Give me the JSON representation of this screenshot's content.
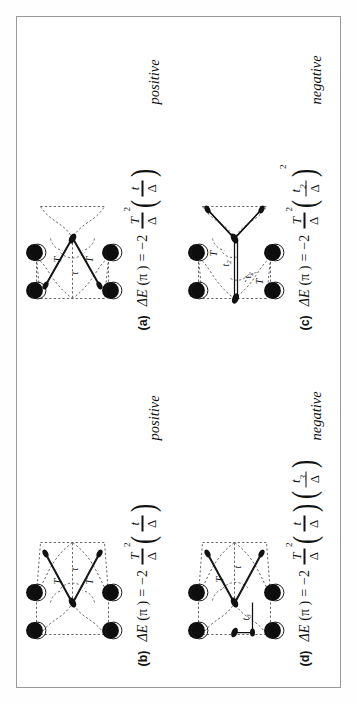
{
  "figure": {
    "kind": "four-panel-physics-diagram",
    "orientation_degrees": -90,
    "frame_color": "#9a9a9a"
  },
  "panels": [
    {
      "id": "a",
      "label": "(a)",
      "sign": "positive",
      "equation": {
        "lhs": "ΔE",
        "arg": "(π )",
        "equals": "=",
        "coefficient": "−2",
        "prefactor_num": "T",
        "prefactor_num_exp": "2",
        "prefactor_den": "Δ",
        "factors": [
          {
            "num": "t",
            "num_sub": "",
            "den": "Δ",
            "exp": ""
          }
        ]
      },
      "diagram": {
        "hop_labels": [
          "T",
          "T",
          "t"
        ],
        "site_count": 4,
        "variant": "single-t-vertical"
      }
    },
    {
      "id": "b",
      "label": "(b)",
      "sign": "positive",
      "equation": {
        "lhs": "ΔE",
        "arg": "(π )",
        "equals": "=",
        "coefficient": "−2",
        "prefactor_num": "T",
        "prefactor_num_exp": "2",
        "prefactor_den": "Δ",
        "factors": [
          {
            "num": "t",
            "num_sub": "",
            "den": "Δ",
            "exp": ""
          }
        ]
      },
      "diagram": {
        "hop_labels": [
          "T",
          "T",
          "t"
        ],
        "site_count": 4,
        "variant": "single-t-mirrored"
      }
    },
    {
      "id": "c",
      "label": "(c)",
      "sign": "negative",
      "equation": {
        "lhs": "ΔE",
        "arg": "(π )",
        "equals": "=",
        "coefficient": "−2",
        "prefactor_num": "T",
        "prefactor_num_exp": "2",
        "prefactor_den": "Δ",
        "factors": [
          {
            "num": "t",
            "num_sub": "2",
            "den": "Δ",
            "exp": "2"
          }
        ]
      },
      "diagram": {
        "hop_labels": [
          "T",
          "T",
          "t₂",
          "t₂"
        ],
        "site_count": 4,
        "variant": "double-t2"
      }
    },
    {
      "id": "d",
      "label": "(d)",
      "sign": "negative",
      "equation": {
        "lhs": "ΔE",
        "arg": "(π )",
        "equals": "=",
        "coefficient": "−2",
        "prefactor_num": "T",
        "prefactor_num_exp": "2",
        "prefactor_den": "Δ",
        "factors": [
          {
            "num": "t",
            "num_sub": "",
            "den": "Δ",
            "exp": ""
          },
          {
            "num": "t",
            "num_sub": "3",
            "den": "Δ",
            "exp": ""
          }
        ]
      },
      "diagram": {
        "hop_labels": [
          "T",
          "t₃",
          "t"
        ],
        "site_count": 4,
        "variant": "t-and-t3"
      }
    }
  ],
  "symbols": {
    "delta": "Δ",
    "pi": "π",
    "minus_two": "−2",
    "T": "T",
    "t": "t"
  }
}
